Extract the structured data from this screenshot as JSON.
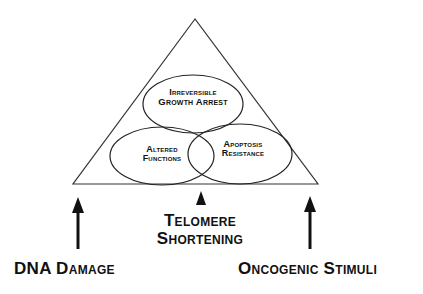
{
  "diagram": {
    "type": "triangle-venn",
    "triangle": {
      "apex": [
        195,
        19
      ],
      "base_left": [
        73,
        184
      ],
      "base_right": [
        318,
        184
      ],
      "stroke": "#333333"
    },
    "ellipses": [
      {
        "id": "irreversible-growth-arrest",
        "line1": "Irreversible",
        "line2": "Growth Arrest"
      },
      {
        "id": "altered-functions",
        "line1": "Altered",
        "line2": "Functions"
      },
      {
        "id": "apoptosis-resistance",
        "line1": "Apoptosis",
        "line2": "Resistance"
      }
    ],
    "inputs": [
      {
        "id": "dna-damage",
        "label": "DNA Damage",
        "arrow": "tall"
      },
      {
        "id": "telomere-shortening",
        "line1": "Telomere",
        "line2": "Shortening",
        "arrow": "short"
      },
      {
        "id": "oncogenic-stimuli",
        "label": "Oncogenic Stimuli",
        "arrow": "tall"
      }
    ],
    "colors": {
      "line": "#222222",
      "text": "#111111",
      "background": "#ffffff"
    }
  }
}
